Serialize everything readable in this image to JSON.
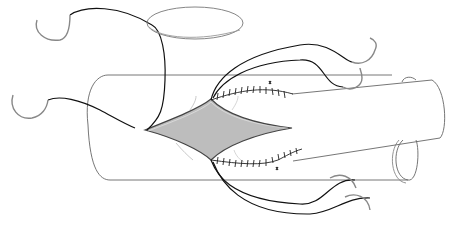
{
  "figure": {
    "title": "Vascular end-to-side anastomosis illustration",
    "colors": {
      "background": "#ffffff",
      "outline": "#555555",
      "suture": "#1a1a1a",
      "needle": "#8a8a8a",
      "arteriotomy_fill": "#bdbdbd",
      "vessel_loop": "#777777"
    },
    "elements": [
      "horizontal-vessel",
      "oblique-vessel",
      "arteriotomy",
      "upper-running-suture",
      "lower-running-suture",
      "needles",
      "vessel-loop"
    ]
  }
}
